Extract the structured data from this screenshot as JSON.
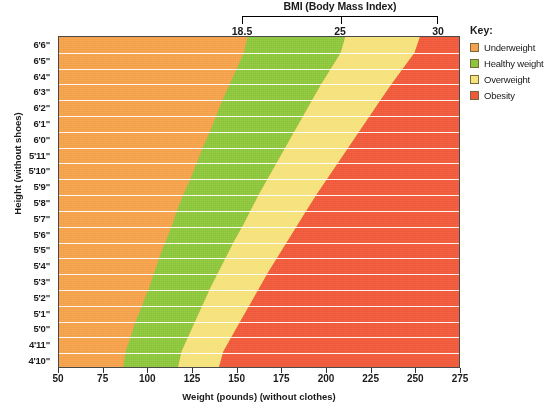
{
  "bmi_header": {
    "title": "BMI (Body Mass Index)",
    "ticks": [
      {
        "label": "18.5",
        "x_pct": 0
      },
      {
        "label": "25",
        "x_pct": 50
      },
      {
        "label": "30",
        "x_pct": 100
      }
    ]
  },
  "legend": {
    "title": "Key:",
    "items": [
      {
        "label": "Underweight",
        "color": "#F5A04B"
      },
      {
        "label": "Healthy weight",
        "color": "#8CC63E"
      },
      {
        "label": "Overweight",
        "color": "#F5E27A"
      },
      {
        "label": "Obesity",
        "color": "#F05A3C"
      }
    ]
  },
  "axes": {
    "x_title": "Weight (pounds) (without clothes)",
    "y_title": "Height (without shoes)",
    "x_ticks": [
      "50",
      "75",
      "100",
      "125",
      "150",
      "175",
      "200",
      "225",
      "250",
      "275"
    ],
    "y_ticks": [
      "6'6\"",
      "6'5\"",
      "6'4\"",
      "6'3\"",
      "6'2\"",
      "6'1\"",
      "6'0\"",
      "5'11\"",
      "5'10\"",
      "5'9\"",
      "5'8\"",
      "5'7\"",
      "5'6\"",
      "5'5\"",
      "5'4\"",
      "5'3\"",
      "5'2\"",
      "5'1\"",
      "5'0\"",
      "4'11\"",
      "4'10\""
    ]
  },
  "chart_data": {
    "type": "heatmap",
    "title": "BMI (Body Mass Index)",
    "xlabel": "Weight (pounds) (without clothes)",
    "ylabel": "Height (without shoes)",
    "xlim": [
      50,
      275
    ],
    "ylim_labels": [
      "4'10\"",
      "6'6\""
    ],
    "grid": false,
    "legend_position": "right",
    "bmi_thresholds": [
      18.5,
      25,
      30
    ],
    "categories": [
      "Underweight",
      "Healthy weight",
      "Overweight",
      "Obesity"
    ],
    "colors": [
      "#F5A04B",
      "#8CC63E",
      "#F5E27A",
      "#F05A3C"
    ],
    "x_ticks": [
      50,
      75,
      100,
      125,
      150,
      175,
      200,
      225,
      250,
      275
    ],
    "rows": [
      {
        "height": "6'6\"",
        "inches": 78,
        "bmi_18_5_lb": 156,
        "bmi_25_lb": 211,
        "bmi_30_lb": 253
      },
      {
        "height": "6'5\"",
        "inches": 77,
        "bmi_18_5_lb": 152,
        "bmi_25_lb": 206,
        "bmi_30_lb": 247
      },
      {
        "height": "6'4\"",
        "inches": 76,
        "bmi_18_5_lb": 148,
        "bmi_25_lb": 200,
        "bmi_30_lb": 240
      },
      {
        "height": "6'3\"",
        "inches": 75,
        "bmi_18_5_lb": 144,
        "bmi_25_lb": 195,
        "bmi_30_lb": 234
      },
      {
        "height": "6'2\"",
        "inches": 74,
        "bmi_18_5_lb": 140,
        "bmi_25_lb": 190,
        "bmi_30_lb": 228
      },
      {
        "height": "6'1\"",
        "inches": 73,
        "bmi_18_5_lb": 137,
        "bmi_25_lb": 185,
        "bmi_30_lb": 222
      },
      {
        "height": "6'0\"",
        "inches": 72,
        "bmi_18_5_lb": 133,
        "bmi_25_lb": 180,
        "bmi_30_lb": 216
      },
      {
        "height": "5'11\"",
        "inches": 71,
        "bmi_18_5_lb": 129,
        "bmi_25_lb": 175,
        "bmi_30_lb": 210
      },
      {
        "height": "5'10\"",
        "inches": 70,
        "bmi_18_5_lb": 126,
        "bmi_25_lb": 170,
        "bmi_30_lb": 204
      },
      {
        "height": "5'9\"",
        "inches": 69,
        "bmi_18_5_lb": 122,
        "bmi_25_lb": 165,
        "bmi_30_lb": 198
      },
      {
        "height": "5'8\"",
        "inches": 68,
        "bmi_18_5_lb": 118,
        "bmi_25_lb": 160,
        "bmi_30_lb": 192
      },
      {
        "height": "5'7\"",
        "inches": 67,
        "bmi_18_5_lb": 115,
        "bmi_25_lb": 156,
        "bmi_30_lb": 187
      },
      {
        "height": "5'6\"",
        "inches": 66,
        "bmi_18_5_lb": 112,
        "bmi_25_lb": 151,
        "bmi_30_lb": 181
      },
      {
        "height": "5'5\"",
        "inches": 65,
        "bmi_18_5_lb": 108,
        "bmi_25_lb": 146,
        "bmi_30_lb": 176
      },
      {
        "height": "5'4\"",
        "inches": 64,
        "bmi_18_5_lb": 105,
        "bmi_25_lb": 142,
        "bmi_30_lb": 170
      },
      {
        "height": "5'3\"",
        "inches": 63,
        "bmi_18_5_lb": 102,
        "bmi_25_lb": 137,
        "bmi_30_lb": 165
      },
      {
        "height": "5'2\"",
        "inches": 62,
        "bmi_18_5_lb": 99,
        "bmi_25_lb": 133,
        "bmi_30_lb": 160
      },
      {
        "height": "5'1\"",
        "inches": 61,
        "bmi_18_5_lb": 95,
        "bmi_25_lb": 129,
        "bmi_30_lb": 155
      },
      {
        "height": "5'0\"",
        "inches": 60,
        "bmi_18_5_lb": 92,
        "bmi_25_lb": 125,
        "bmi_30_lb": 150
      },
      {
        "height": "4'11\"",
        "inches": 59,
        "bmi_18_5_lb": 89,
        "bmi_25_lb": 121,
        "bmi_30_lb": 145
      },
      {
        "height": "4'10\"",
        "inches": 58,
        "bmi_18_5_lb": 86,
        "bmi_25_lb": 117,
        "bmi_30_lb": 140
      }
    ]
  }
}
